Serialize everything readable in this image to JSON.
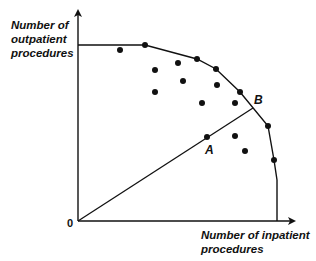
{
  "diagram": {
    "y_axis_label": "Number of\noutpatient\nprocedures",
    "x_axis_label": "Number of inpatient\nprocedures",
    "origin_label": "0",
    "point_a_label": "A",
    "point_b_label": "B",
    "colors": {
      "line": "#111111",
      "dot": "#111111",
      "background": "#ffffff"
    },
    "origin_px": [
      78,
      221
    ],
    "frontier_vertices_px": [
      [
        78,
        45
      ],
      [
        145,
        45
      ],
      [
        197,
        59
      ],
      [
        216,
        69
      ],
      [
        240,
        92
      ],
      [
        268,
        126
      ],
      [
        274,
        160
      ],
      [
        277,
        180
      ],
      [
        277,
        221
      ]
    ],
    "frontier_dots_px": [
      [
        145,
        45
      ],
      [
        197,
        59
      ],
      [
        216,
        69
      ],
      [
        240,
        92
      ],
      [
        268,
        126
      ],
      [
        274,
        160
      ]
    ],
    "interior_dots_px": [
      [
        120,
        50
      ],
      [
        178,
        63
      ],
      [
        155,
        70
      ],
      [
        183,
        81
      ],
      [
        155,
        92
      ],
      [
        217,
        85
      ],
      [
        202,
        103
      ],
      [
        235,
        103
      ],
      [
        235,
        136
      ],
      [
        245,
        151
      ]
    ],
    "point_a_px": [
      207,
      137
    ],
    "point_b_px": [
      253,
      108
    ]
  }
}
